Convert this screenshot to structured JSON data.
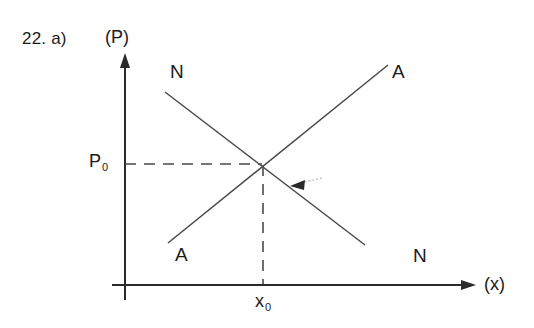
{
  "figure": {
    "problem_label": "22. a)",
    "axes": {
      "y_label": "(P)",
      "x_label": "(x)",
      "origin_x": 125,
      "origin_y": 285
    },
    "curves": [
      {
        "id": "demand-curve-n",
        "label": "N",
        "label_top": "N",
        "label_bottom": "N",
        "slope": "downward",
        "start": [
          165,
          92
        ],
        "end": [
          365,
          245
        ]
      },
      {
        "id": "supply-curve-a",
        "label": "A",
        "label_top": "A",
        "label_bottom": "A",
        "slope": "upward",
        "start": [
          168,
          243
        ],
        "end": [
          388,
          65
        ]
      }
    ],
    "equilibrium": {
      "price_label": "P",
      "price_subscript": "0",
      "quantity_label": "x",
      "quantity_subscript": "0",
      "point": [
        263,
        163
      ]
    },
    "annotation": {
      "shift_arrow": "arrow-up-left-on-n-curve"
    },
    "colors": {
      "ink": "#1a1a1a",
      "line": "#3a3a3a",
      "background": "#ffffff"
    }
  }
}
